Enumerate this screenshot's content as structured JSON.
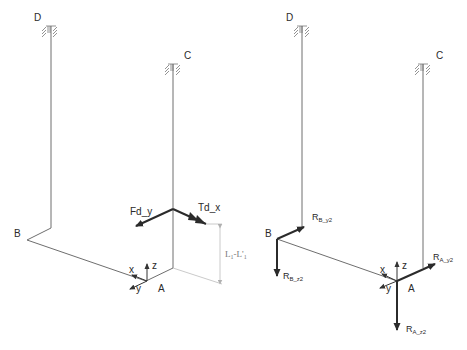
{
  "diagram": {
    "title": "",
    "left": {
      "nodes": {
        "D": "D",
        "C": "C",
        "B": "B",
        "A": "A"
      },
      "axes": {
        "x": "x",
        "y": "y",
        "z": "z"
      },
      "loads": {
        "force": "Fd_y",
        "torque": "Td_x"
      },
      "dimension": {
        "base": "L",
        "sub": "1",
        "sep": "-L'",
        "sub2": "1"
      }
    },
    "right": {
      "nodes": {
        "D": "D",
        "C": "C",
        "B": "B",
        "A": "A"
      },
      "axes": {
        "x": "x",
        "y": "y",
        "z": "z"
      },
      "reactions": {
        "RB_y2": {
          "main": "R",
          "sub": "B_y2"
        },
        "RB_z2": {
          "main": "R",
          "sub": "B_z2"
        },
        "RA_y2": {
          "main": "R",
          "sub": "A_y2"
        },
        "RA_z2": {
          "main": "R",
          "sub": "A_z2"
        }
      }
    },
    "colors": {
      "structure": "#6e6e6e",
      "load_arrow": "#2b2b2b",
      "dimension": "#b5b5b5",
      "text": "#2a2a2a"
    }
  }
}
